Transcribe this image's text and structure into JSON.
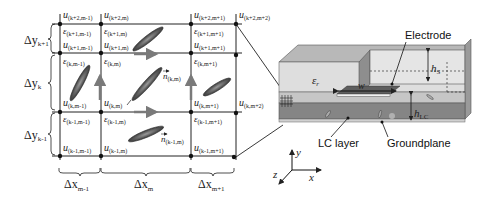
{
  "grid": {
    "nodes": [
      {
        "row": "k+2",
        "col": "m-1",
        "u": "u",
        "sub": "(k+2,m-1)"
      },
      {
        "row": "k+2",
        "col": "m",
        "u": "u",
        "sub": "(k+2,m)"
      },
      {
        "row": "k+2",
        "col": "m+1",
        "u": "u",
        "sub": "(k+2,m+1)"
      },
      {
        "row": "k+2",
        "col": "m+2",
        "u": "u",
        "sub": "(k+2,m+2)"
      }
    ],
    "cells": {
      "row_k1": {
        "eps": [
          "(k+1,m-1)",
          "(k+1,m)",
          "(k+1,m+1)"
        ],
        "u": [
          "(k+1,m-1)",
          "(k+1,m)",
          "(k+1,m+1)"
        ]
      },
      "row_k": {
        "eps": [
          "(k,m-1)",
          "(k,m)",
          "(k,m+1)"
        ],
        "u": [
          "(k,m-1)",
          "(k,m)",
          "(k,m+1)",
          "(k,m+2)"
        ]
      },
      "row_km1": {
        "eps": [
          "(k-1,m-1)",
          "(k-1,m)",
          "(k-1,m+1)"
        ],
        "u": [
          "(k-1,m-1)",
          "(k-1,m)",
          "(k-1,m+1)"
        ]
      }
    },
    "eps_symbol": "ε",
    "u_symbol": "u",
    "n_symbol": "n",
    "director_labels": [
      "(k,m)",
      "(k-1,m)"
    ],
    "y_spacings": [
      {
        "symbol": "Δy",
        "sub": "k+1"
      },
      {
        "symbol": "Δy",
        "sub": "k"
      },
      {
        "symbol": "Δy",
        "sub": "k-1"
      }
    ],
    "x_spacings": [
      {
        "symbol": "Δx",
        "sub": "m-1"
      },
      {
        "symbol": "Δx",
        "sub": "m"
      },
      {
        "symbol": "Δx",
        "sub": "m+1"
      }
    ]
  },
  "device": {
    "electrode_label": "Electrode",
    "lc_layer_label": "LC layer",
    "groundplane_label": "Groundplane",
    "eps_r": {
      "symbol": "ε",
      "sub": "r"
    },
    "width_label": "w",
    "hs": {
      "symbol": "h",
      "sub": "S"
    },
    "hlc": {
      "symbol": "h",
      "sub": "LC"
    }
  },
  "axes": {
    "x": "x",
    "y": "y",
    "z": "z"
  },
  "colors": {
    "line": "#222222",
    "arrow": "#7a7a7a",
    "director": "#6b6b6b",
    "substrate_top": "#bdbdbd",
    "substrate_front": "#d4d4d4",
    "lc_front": "#8a8a8a",
    "electrode": "#e8e8e8"
  }
}
